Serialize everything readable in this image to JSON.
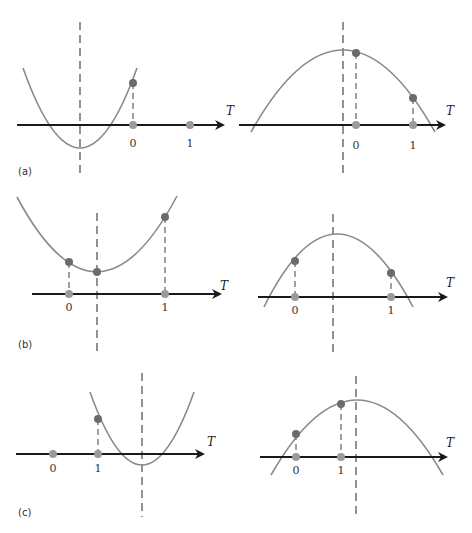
{
  "figure": {
    "colors": {
      "axis": "#1a1a1a",
      "curve": "#8a8a8a",
      "dashed": "#777777",
      "point_on_curve": "#6b6b6b",
      "point_on_axis": "#9a9a9a",
      "text": "#333333"
    },
    "axis_label": "T",
    "panels": [
      {
        "label": "(a)",
        "left": {
          "shape": "upward parabola",
          "axis": {
            "x1": 17,
            "x2": 223,
            "y": 125
          },
          "curve": {
            "x0": 23,
            "y0": 68,
            "cx": 80,
            "cy": 228,
            "x1": 137,
            "y1": 68
          },
          "symmetry_line": {
            "x": 80,
            "y1": 22,
            "y2": 178
          },
          "points": [
            {
              "tick": "0",
              "x": 133,
              "y_curve": 83
            },
            {
              "tick": "1",
              "x": 190,
              "y_curve": null
            }
          ],
          "tick_label_y": 147,
          "axis_label_pos": {
            "x": 226,
            "y": 115
          },
          "panel_label_pos": {
            "x": 18,
            "y": 175
          }
        },
        "right": {
          "shape": "downward parabola",
          "axis": {
            "x1": 239,
            "x2": 444,
            "y": 125
          },
          "curve": {
            "x0": 251,
            "y0": 132,
            "cx": 343,
            "cy": -32,
            "x1": 435,
            "y1": 132
          },
          "symmetry_line": {
            "x": 343,
            "y1": 22,
            "y2": 178
          },
          "points": [
            {
              "tick": "0",
              "x": 356,
              "y_curve": 53
            },
            {
              "tick": "1",
              "x": 413,
              "y_curve": 98
            }
          ],
          "tick_label_y": 149,
          "axis_label_pos": {
            "x": 446,
            "y": 115
          }
        }
      },
      {
        "label": "(b)",
        "left": {
          "shape": "upward parabola",
          "axis": {
            "x1": 32,
            "x2": 220,
            "y": 294
          },
          "curve": {
            "x0": 17,
            "y0": 197,
            "cx": 97,
            "cy": 347,
            "x1": 177,
            "y1": 196
          },
          "symmetry_line": {
            "x": 97,
            "y1": 213,
            "y2": 355
          },
          "points": [
            {
              "tick": "0",
              "x": 69,
              "y_curve": 262
            },
            {
              "tick": "",
              "x": 97,
              "y_curve": 272,
              "axis_point": false
            },
            {
              "tick": "1",
              "x": 165,
              "y_curve": 217
            }
          ],
          "tick_label_y": 311,
          "axis_label_pos": {
            "x": 220,
            "y": 290
          },
          "panel_label_pos": {
            "x": 18,
            "y": 348
          }
        },
        "right": {
          "shape": "downward parabola",
          "axis": {
            "x1": 258,
            "x2": 446,
            "y": 297
          },
          "curve": {
            "x0": 264,
            "y0": 307,
            "cx": 336,
            "cy": 161,
            "x1": 413,
            "y1": 307
          },
          "symmetry_line": {
            "x": 333,
            "y1": 214,
            "y2": 357
          },
          "points": [
            {
              "tick": "0",
              "x": 295,
              "y_curve": 261
            },
            {
              "tick": "1",
              "x": 391,
              "y_curve": 273
            }
          ],
          "tick_label_y": 314,
          "axis_label_pos": {
            "x": 446,
            "y": 287
          }
        }
      },
      {
        "label": "(c)",
        "left": {
          "shape": "upward parabola",
          "axis": {
            "x1": 16,
            "x2": 203,
            "y": 454
          },
          "curve": {
            "x0": 90,
            "y0": 392,
            "cx": 142,
            "cy": 538,
            "x1": 194,
            "y1": 392
          },
          "symmetry_line": {
            "x": 142,
            "y1": 373,
            "y2": 517
          },
          "points": [
            {
              "tick": "0",
              "x": 53,
              "y_curve": null
            },
            {
              "tick": "1",
              "x": 98,
              "y_curve": 419
            }
          ],
          "tick_label_y": 472,
          "axis_label_pos": {
            "x": 207,
            "y": 446
          },
          "panel_label_pos": {
            "x": 18,
            "y": 516
          }
        },
        "right": {
          "shape": "downward parabola",
          "axis": {
            "x1": 260,
            "x2": 446,
            "y": 457
          },
          "curve": {
            "x0": 271,
            "y0": 475,
            "cx": 357,
            "cy": 325,
            "x1": 443,
            "y1": 475
          },
          "symmetry_line": {
            "x": 356,
            "y1": 376,
            "y2": 518
          },
          "points": [
            {
              "tick": "0",
              "x": 296,
              "y_curve": 434
            },
            {
              "tick": "1",
              "x": 341,
              "y_curve": 404
            }
          ],
          "tick_label_y": 474,
          "axis_label_pos": {
            "x": 446,
            "y": 447
          }
        }
      }
    ]
  }
}
